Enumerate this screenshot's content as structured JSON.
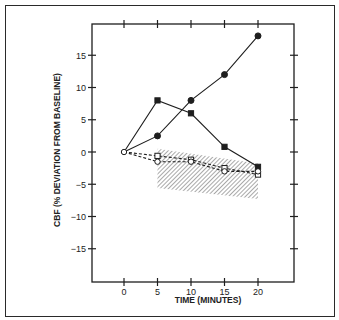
{
  "chart_data": {
    "type": "line",
    "title": "",
    "xlabel": "TIME (MINUTES)",
    "ylabel": "CBF (% DEVIATION FROM BASELINE)",
    "x": [
      0,
      5,
      10,
      15,
      20
    ],
    "xticks": [
      0,
      5,
      10,
      15,
      20
    ],
    "yticks": [
      15,
      10,
      5,
      0,
      -5,
      -10,
      -15
    ],
    "xlim": [
      -4.5,
      25
    ],
    "ylim": [
      -20,
      20
    ],
    "grid": false,
    "legend": null,
    "series": [
      {
        "name": "filled-circle",
        "marker": "filled-circle",
        "line": "solid",
        "values": [
          0,
          2.5,
          8,
          12,
          18
        ]
      },
      {
        "name": "filled-square",
        "marker": "filled-square",
        "line": "solid",
        "values": [
          0,
          8,
          6,
          0.8,
          -2.3
        ]
      },
      {
        "name": "open-square",
        "marker": "open-square",
        "line": "dashed",
        "values": [
          0,
          -0.6,
          -1.2,
          -2.5,
          -3.5
        ]
      },
      {
        "name": "open-circle",
        "marker": "open-circle",
        "line": "dashed",
        "values": [
          0,
          -1.5,
          -1.5,
          -3,
          -3
        ]
      }
    ],
    "shaded_band": {
      "style": "hatched",
      "x": [
        5,
        20
      ],
      "upper": [
        0.5,
        -1.8
      ],
      "lower": [
        -5.6,
        -7.3
      ]
    }
  },
  "axes": {
    "x_title": "TIME (MINUTES)",
    "y_title": "CBF (% DEVIATION FROM BASELINE)",
    "x_tick_labels": [
      "0",
      "5",
      "10",
      "15",
      "20"
    ],
    "y_tick_labels": [
      "15",
      "10",
      "5",
      "0",
      "−5",
      "−10",
      "−15"
    ]
  },
  "colors": {
    "ink": "#1e1e1e",
    "hatch": "#7a7a7a",
    "background": "#ffffff"
  }
}
